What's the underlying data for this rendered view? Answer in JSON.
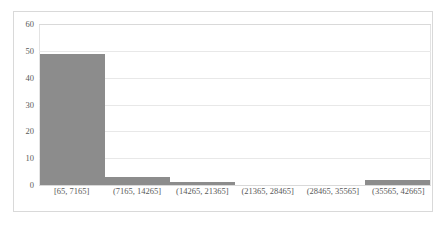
{
  "chart_data": {
    "type": "bar",
    "title": "",
    "subtitle": "",
    "xlabel": "",
    "ylabel": "",
    "categories": [
      "[65, 7165]",
      "(7165, 14265]",
      "(14265, 21365]",
      "(21365, 28465]",
      "(28465, 35565]",
      "(35565, 42665]"
    ],
    "values": [
      49,
      3,
      1,
      0,
      0,
      2
    ],
    "ylim": [
      0,
      60
    ],
    "ytick_labels": [
      "60",
      "50",
      "40",
      "30",
      "20",
      "10",
      "0"
    ],
    "ytick_values": [
      60,
      50,
      40,
      30,
      20,
      10,
      0
    ],
    "grid": true,
    "legend": false,
    "legend_position": "none",
    "bar_color": "#8c8c8c",
    "gridline_color": "#e8e8e8",
    "axis_color": "#d9d9d9",
    "label_color": "#595959",
    "plot_background": "#ffffff"
  }
}
